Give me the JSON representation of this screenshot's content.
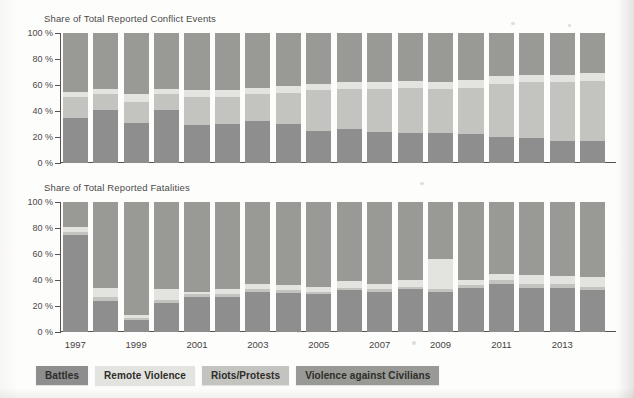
{
  "figure": {
    "categories": [
      {
        "key": "battles",
        "label": "Battles",
        "color": "#8e8e8e"
      },
      {
        "key": "remote_violence",
        "label": "Remote Violence",
        "color": "#e3e3e0"
      },
      {
        "key": "riots_protests",
        "label": "Riots/Protests",
        "color": "#c3c3bf"
      },
      {
        "key": "violence_against_civilians",
        "label": "Violence against Civilians",
        "color": "#999996"
      }
    ],
    "x_tick_labels": [
      "1997",
      "1999",
      "2001",
      "2003",
      "2005",
      "2007",
      "2009",
      "2011",
      "2013"
    ],
    "y_tick_labels": [
      "0 %",
      "20 %",
      "40 %",
      "60 %",
      "80 %",
      "100 %"
    ]
  },
  "chart_data": [
    {
      "type": "bar",
      "title": "Share of Total Reported Conflict Events",
      "xlabel": "",
      "ylabel": "",
      "ylim": [
        0,
        100
      ],
      "yticks": [
        0,
        20,
        40,
        60,
        80,
        100
      ],
      "ytick_labels": [
        "0 %",
        "20 %",
        "40 %",
        "60 %",
        "80 %",
        "100 %"
      ],
      "stacked": true,
      "stack_order_bottom_to_top": [
        "battles",
        "riots_protests",
        "remote_violence",
        "violence_against_civilians"
      ],
      "grid": false,
      "legend_position": "below",
      "categories": [
        "1997",
        "1998",
        "1999",
        "2000",
        "2001",
        "2002",
        "2003",
        "2004",
        "2005",
        "2006",
        "2007",
        "2008",
        "2009",
        "2010",
        "2011",
        "2012",
        "2013",
        "2014"
      ],
      "series": [
        {
          "name": "Battles",
          "values": [
            35,
            41,
            31,
            41,
            29,
            30,
            32,
            30,
            25,
            26,
            24,
            23,
            23,
            22,
            20,
            19,
            17,
            17
          ]
        },
        {
          "name": "Riots/Protests",
          "values": [
            16,
            12,
            16,
            12,
            22,
            21,
            21,
            24,
            31,
            31,
            33,
            35,
            34,
            36,
            41,
            43,
            45,
            46
          ]
        },
        {
          "name": "Remote Violence",
          "values": [
            4,
            4,
            6,
            4,
            5,
            5,
            5,
            5,
            5,
            5,
            5,
            5,
            5,
            6,
            6,
            6,
            6,
            6
          ]
        },
        {
          "name": "Violence against Civilians",
          "values": [
            45,
            43,
            47,
            43,
            44,
            44,
            42,
            41,
            39,
            38,
            38,
            37,
            38,
            36,
            33,
            32,
            32,
            31
          ]
        }
      ]
    },
    {
      "type": "bar",
      "title": "Share of Total Reported Fatalities",
      "xlabel": "",
      "ylabel": "",
      "ylim": [
        0,
        100
      ],
      "yticks": [
        0,
        20,
        40,
        60,
        80,
        100
      ],
      "ytick_labels": [
        "0 %",
        "20 %",
        "40 %",
        "60 %",
        "80 %",
        "100 %"
      ],
      "stacked": true,
      "stack_order_bottom_to_top": [
        "battles",
        "riots_protests",
        "remote_violence",
        "violence_against_civilians"
      ],
      "grid": false,
      "legend_position": "below",
      "categories": [
        "1997",
        "1998",
        "1999",
        "2000",
        "2001",
        "2002",
        "2003",
        "2004",
        "2005",
        "2006",
        "2007",
        "2008",
        "2009",
        "2010",
        "2011",
        "2012",
        "2013",
        "2014"
      ],
      "series": [
        {
          "name": "Battles",
          "values": [
            75,
            24,
            9,
            22,
            27,
            27,
            31,
            30,
            29,
            32,
            31,
            33,
            31,
            34,
            37,
            34,
            34,
            32
          ]
        },
        {
          "name": "Riots/Protests",
          "values": [
            2,
            3,
            2,
            3,
            2,
            2,
            2,
            2,
            2,
            2,
            2,
            2,
            2,
            2,
            3,
            3,
            3,
            3
          ]
        },
        {
          "name": "Remote Violence",
          "values": [
            4,
            7,
            2,
            8,
            2,
            4,
            4,
            4,
            4,
            5,
            4,
            5,
            23,
            4,
            5,
            7,
            6,
            7
          ]
        },
        {
          "name": "Violence against Civilians",
          "values": [
            19,
            66,
            87,
            67,
            69,
            67,
            63,
            64,
            65,
            61,
            63,
            60,
            44,
            60,
            55,
            56,
            57,
            58
          ]
        }
      ]
    }
  ]
}
